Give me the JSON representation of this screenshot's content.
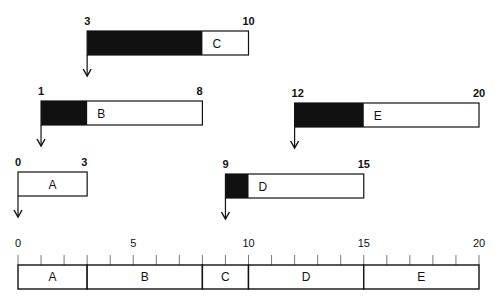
{
  "diagram": {
    "scale": {
      "min": 0,
      "max": 20,
      "major_ticks": [
        0,
        5,
        10,
        15,
        20
      ],
      "minor_step": 1
    },
    "tasks": [
      {
        "name": "A",
        "start": 0,
        "end": 3,
        "filled_until": 0,
        "start_label": "0",
        "end_label": "3"
      },
      {
        "name": "B",
        "start": 1,
        "end": 8,
        "filled_until": 3,
        "start_label": "1",
        "end_label": "8"
      },
      {
        "name": "C",
        "start": 3,
        "end": 10,
        "filled_until": 8,
        "start_label": "3",
        "end_label": "10"
      },
      {
        "name": "D",
        "start": 9,
        "end": 15,
        "filled_until": 10,
        "start_label": "9",
        "end_label": "15"
      },
      {
        "name": "E",
        "start": 12,
        "end": 20,
        "filled_until": 15,
        "start_label": "12",
        "end_label": "20"
      }
    ],
    "timeline_segments": [
      {
        "name": "A",
        "start": 0,
        "end": 3
      },
      {
        "name": "B",
        "start": 3,
        "end": 8
      },
      {
        "name": "C",
        "start": 8,
        "end": 10
      },
      {
        "name": "D",
        "start": 10,
        "end": 15
      },
      {
        "name": "E",
        "start": 15,
        "end": 20
      }
    ],
    "colors": {
      "fill": "#111111",
      "stroke": "#111111",
      "background": "#ffffff"
    }
  }
}
